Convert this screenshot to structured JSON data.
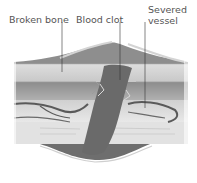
{
  "labels": {
    "broken_bone": "Broken bone",
    "blood_clot": "Blood clot",
    "severed_vessel_line1": "Severed",
    "severed_vessel_line2": "vessel"
  },
  "colors": {
    "text": "#555555",
    "leader": "#333333",
    "skin_top": "#8a8a8a",
    "fat_layer": "#d8d8d8",
    "muscle": "#9a9a9a",
    "tissue_light": "#dcdcdc",
    "vessel": "#5a5a5a",
    "clot": "#6e6e6e",
    "bone": "#e4e4e4"
  }
}
